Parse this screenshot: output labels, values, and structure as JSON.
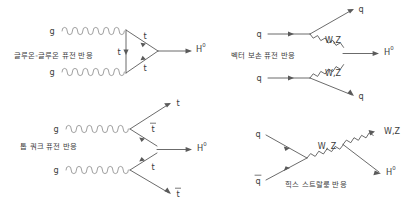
{
  "figure": {
    "background_color": "#ffffff",
    "line_color": "#5a5a5a",
    "coil_color": "#8e8e8e",
    "text_color": "#3c3c3c"
  },
  "diagrams": [
    {
      "id": "gluon-gluon-fusion",
      "caption": "글루온-글루온 퓨전 반응",
      "incoming": [
        "g",
        "g"
      ],
      "internal": [
        "t",
        "t",
        "t"
      ],
      "outgoing": [
        "H"
      ],
      "outgoing_superscript": "0"
    },
    {
      "id": "vector-boson-fusion",
      "caption": "벡터 보손 퓨전 반응",
      "incoming": [
        "q",
        "q"
      ],
      "internal": [
        "W,Z",
        "W,Z"
      ],
      "outgoing": [
        "q",
        "q",
        "H"
      ],
      "outgoing_superscript": "0"
    },
    {
      "id": "top-quark-fusion",
      "caption": "톱 쿼크 퓨전 반응",
      "incoming": [
        "g",
        "g"
      ],
      "internal": [
        "t",
        "t"
      ],
      "outgoing": [
        "t",
        "t̄",
        "t̄",
        "H"
      ],
      "outgoing_superscript": "0"
    },
    {
      "id": "higgs-strahlung",
      "caption": "힉스 스트랄룽 반응",
      "incoming": [
        "q",
        "q̄"
      ],
      "internal": [
        "W, Z"
      ],
      "outgoing": [
        "W,Z",
        "H"
      ],
      "outgoing_superscript": "0"
    }
  ],
  "labels": {
    "gluon": "g",
    "quark": "q",
    "antiquark": "q",
    "top": "t",
    "antitop": "t",
    "higgs": "H",
    "higgs_sup": "0",
    "wz_comma": "W,Z",
    "wz_comma_space": "W, Z"
  }
}
